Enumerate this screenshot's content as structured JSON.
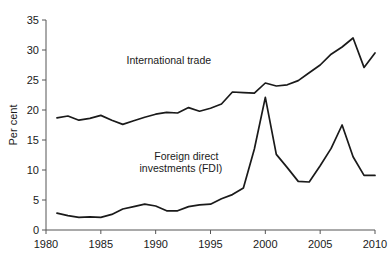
{
  "chart_data": {
    "type": "line",
    "title": "",
    "xlabel": "",
    "ylabel": "Per cent",
    "xlim": [
      1980,
      2010
    ],
    "ylim": [
      0,
      35
    ],
    "xticks": [
      1980,
      1985,
      1990,
      1995,
      2000,
      2005,
      2010
    ],
    "yticks": [
      0,
      5,
      10,
      15,
      20,
      25,
      30,
      35
    ],
    "grid": false,
    "legend_position": "inline-annotation",
    "annotations": [
      {
        "text": "International trade",
        "x": 1991.2,
        "y": 27.6
      },
      {
        "text": "Foreign direct",
        "x": 1992.8,
        "y": 11.6
      },
      {
        "text": "investments (FDI)",
        "x": 1992.3,
        "y": 9.7
      }
    ],
    "series": [
      {
        "name": "International trade",
        "x": [
          1981,
          1982,
          1983,
          1984,
          1985,
          1986,
          1987,
          1988,
          1989,
          1990,
          1991,
          1992,
          1993,
          1994,
          1995,
          1996,
          1997,
          1998,
          1999,
          2000,
          2001,
          2002,
          2003,
          2004,
          2005,
          2006,
          2007,
          2008,
          2009,
          2010
        ],
        "values": [
          18.7,
          19.0,
          18.3,
          18.6,
          19.1,
          18.3,
          17.6,
          18.2,
          18.8,
          19.3,
          19.6,
          19.5,
          20.4,
          19.8,
          20.3,
          21.0,
          23.0,
          22.9,
          22.8,
          24.5,
          24.0,
          24.2,
          24.9,
          26.2,
          27.5,
          29.3,
          30.5,
          32.0,
          27.1,
          29.5
        ]
      },
      {
        "name": "Foreign direct investments (FDI)",
        "x": [
          1981,
          1982,
          1983,
          1984,
          1985,
          1986,
          1987,
          1988,
          1989,
          1990,
          1991,
          1992,
          1993,
          1994,
          1995,
          1996,
          1997,
          1998,
          1999,
          2000,
          2001,
          2002,
          2003,
          2004,
          2005,
          2006,
          2007,
          2008,
          2009,
          2010
        ],
        "values": [
          2.8,
          2.4,
          2.1,
          2.2,
          2.1,
          2.6,
          3.5,
          3.9,
          4.3,
          4.0,
          3.2,
          3.2,
          3.9,
          4.2,
          4.3,
          5.2,
          5.9,
          7.0,
          13.5,
          22.1,
          12.6,
          10.4,
          8.1,
          8.0,
          10.7,
          13.6,
          17.5,
          12.2,
          9.1,
          9.1
        ]
      }
    ]
  },
  "axis": {
    "y_title": "Per cent"
  }
}
